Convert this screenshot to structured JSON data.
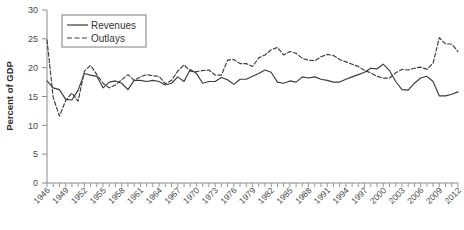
{
  "chart_data": {
    "type": "line",
    "title": "",
    "xlabel": "",
    "ylabel": "Percent of GDP",
    "ylim": [
      0,
      30
    ],
    "yticks": [
      0,
      5,
      10,
      15,
      20,
      25,
      30
    ],
    "xlim": [
      1946,
      2012
    ],
    "xticks": [
      1946,
      1949,
      1952,
      1955,
      1958,
      1961,
      1964,
      1967,
      1970,
      1973,
      1976,
      1979,
      1982,
      1985,
      1988,
      1991,
      1994,
      1997,
      2000,
      2003,
      2006,
      2009,
      2012
    ],
    "xtick_labels": [
      "1946",
      "1949",
      "1952",
      "1955",
      "1958",
      "1961",
      "1964",
      "1967",
      "1970",
      "1973",
      "1976",
      "1979",
      "1982",
      "1985",
      "1988",
      "1991",
      "1994",
      "1997",
      "2000",
      "2003",
      "2006",
      "2009",
      "2012"
    ],
    "grid": false,
    "legend_position": "top-left",
    "x": [
      1946,
      1947,
      1948,
      1949,
      1950,
      1951,
      1952,
      1953,
      1954,
      1955,
      1956,
      1957,
      1958,
      1959,
      1960,
      1961,
      1962,
      1963,
      1964,
      1965,
      1966,
      1967,
      1968,
      1969,
      1970,
      1971,
      1972,
      1973,
      1974,
      1975,
      1976,
      1977,
      1978,
      1979,
      1980,
      1981,
      1982,
      1983,
      1984,
      1985,
      1986,
      1987,
      1988,
      1989,
      1990,
      1991,
      1992,
      1993,
      1994,
      1995,
      1996,
      1997,
      1998,
      1999,
      2000,
      2001,
      2002,
      2003,
      2004,
      2005,
      2006,
      2007,
      2008,
      2009,
      2010,
      2011,
      2012
    ],
    "series": [
      {
        "name": "Revenues",
        "style": "solid",
        "color": "#3a3a3a",
        "values": [
          17.7,
          16.5,
          16.2,
          14.5,
          14.4,
          16.1,
          19.0,
          18.7,
          18.5,
          16.5,
          17.5,
          17.7,
          17.3,
          16.2,
          17.8,
          17.8,
          17.6,
          17.8,
          17.6,
          17.0,
          17.3,
          18.4,
          17.6,
          19.7,
          19.0,
          17.3,
          17.6,
          17.6,
          18.3,
          17.9,
          17.1,
          18.0,
          18.0,
          18.5,
          19.0,
          19.6,
          19.2,
          17.5,
          17.3,
          17.7,
          17.5,
          18.4,
          18.2,
          18.4,
          18.0,
          17.8,
          17.5,
          17.5,
          18.0,
          18.4,
          18.8,
          19.2,
          19.9,
          19.8,
          20.6,
          19.5,
          17.6,
          16.2,
          16.1,
          17.3,
          18.2,
          18.5,
          17.6,
          15.1,
          15.1,
          15.4,
          15.8
        ]
      },
      {
        "name": "Outlays",
        "style": "dashed",
        "color": "#3a3a3a",
        "values": [
          24.8,
          14.8,
          11.6,
          14.3,
          15.6,
          14.2,
          19.4,
          20.4,
          18.8,
          17.3,
          16.5,
          17.0,
          17.9,
          18.8,
          17.8,
          18.4,
          18.8,
          18.6,
          18.5,
          17.2,
          17.8,
          19.4,
          20.5,
          19.4,
          19.3,
          19.5,
          19.6,
          18.7,
          18.7,
          21.3,
          21.4,
          20.7,
          20.7,
          20.2,
          21.7,
          22.2,
          23.1,
          23.5,
          22.2,
          22.8,
          22.5,
          21.6,
          21.3,
          21.2,
          21.9,
          22.3,
          22.1,
          21.4,
          21.0,
          20.6,
          20.2,
          19.5,
          19.1,
          18.5,
          18.2,
          18.2,
          19.1,
          19.7,
          19.6,
          19.9,
          20.1,
          19.7,
          20.8,
          25.2,
          24.1,
          24.1,
          22.8
        ]
      }
    ]
  },
  "legend": {
    "items": [
      {
        "label": "Revenues",
        "style": "solid"
      },
      {
        "label": "Outlays",
        "style": "dashed"
      }
    ]
  },
  "axes": {
    "y_title": "Percent of GDP"
  }
}
